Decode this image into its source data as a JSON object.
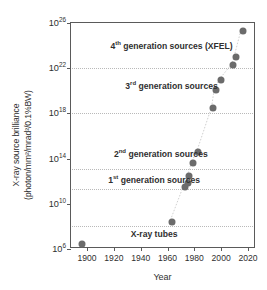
{
  "chart_data": {
    "type": "scatter",
    "title": "",
    "xlabel": "Year",
    "ylabel_line1": "X-ray source brilliance",
    "ylabel_line2": "(photon/mm²/mrad²/0.1%BW)",
    "xlim": [
      1888,
      2026
    ],
    "ylim_exponent": [
      6,
      26
    ],
    "yscale": "log",
    "grid": true,
    "legend": "none",
    "xticks": [
      "1900",
      "1920",
      "1940",
      "1960",
      "1980",
      "2000",
      "2020"
    ],
    "xtick_values": [
      1900,
      1920,
      1940,
      1960,
      1980,
      2000,
      2020
    ],
    "yticks": [
      {
        "mantissa": "10",
        "exponent": "26",
        "value_exp": 26
      },
      {
        "mantissa": "10",
        "exponent": "22",
        "value_exp": 22
      },
      {
        "mantissa": "10",
        "exponent": "18",
        "value_exp": 18
      },
      {
        "mantissa": "10",
        "exponent": "14",
        "value_exp": 14
      },
      {
        "mantissa": "10",
        "exponent": "10",
        "value_exp": 10
      },
      {
        "mantissa": "10",
        "exponent": "6",
        "value_exp": 6
      }
    ],
    "gridline_exponents": [
      22,
      18,
      13.1,
      11.3,
      8.0
    ],
    "points": [
      {
        "x": 1896,
        "y_exp": 6.4
      },
      {
        "x": 1963,
        "y_exp": 8.4
      },
      {
        "x": 1973,
        "y_exp": 11.5
      },
      {
        "x": 1975,
        "y_exp": 11.8
      },
      {
        "x": 1976,
        "y_exp": 12.5
      },
      {
        "x": 1979,
        "y_exp": 13.6
      },
      {
        "x": 1983,
        "y_exp": 14.6
      },
      {
        "x": 1994,
        "y_exp": 18.5
      },
      {
        "x": 1996,
        "y_exp": 20.1
      },
      {
        "x": 2000,
        "y_exp": 21.0
      },
      {
        "x": 2009,
        "y_exp": 22.3
      },
      {
        "x": 2011,
        "y_exp": 23.0
      },
      {
        "x": 2016,
        "y_exp": 25.3
      }
    ],
    "annotations": [
      {
        "id": "gen4",
        "ordinal": "4",
        "suffix": "th",
        "text": " generation sources (XFEL)",
        "x": 1963,
        "y_exp": 24.0
      },
      {
        "id": "gen3",
        "ordinal": "3",
        "suffix": "rd",
        "text": " generation sources",
        "x": 1963,
        "y_exp": 20.4
      },
      {
        "id": "gen2",
        "ordinal": "2",
        "suffix": "nd",
        "text": " generation sources",
        "x": 1955,
        "y_exp": 14.4
      },
      {
        "id": "gen1",
        "ordinal": "1",
        "suffix": "st",
        "text": " generation sources",
        "x": 1950,
        "y_exp": 12.1
      },
      {
        "id": "tubes",
        "ordinal": "",
        "suffix": "",
        "text": "X-ray tubes",
        "x": 1950,
        "y_exp": 7.3
      }
    ],
    "marker_color": "#6b6b6b",
    "axis_color": "#5a5a5a",
    "grid_color": "#b9b9b9",
    "text_color": "#2f2f2f"
  }
}
